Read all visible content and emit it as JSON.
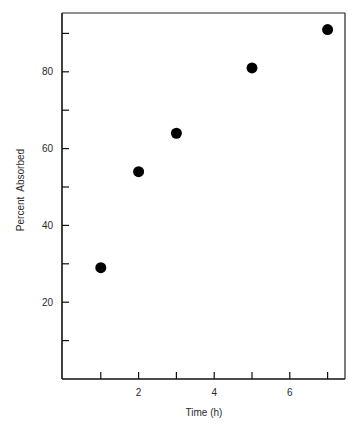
{
  "chart_data": {
    "type": "scatter",
    "title": "",
    "xlabel": "Time (h)",
    "ylabel": "Percent  Absorbed",
    "xlim": [
      0,
      7.5
    ],
    "ylim": [
      0,
      95
    ],
    "x_ticks": [
      1,
      2,
      3,
      4,
      5,
      6,
      7
    ],
    "x_tick_labels": [
      "",
      "2",
      "",
      "4",
      "",
      "6",
      ""
    ],
    "y_ticks": [
      10,
      20,
      30,
      40,
      50,
      60,
      70,
      80,
      90
    ],
    "y_tick_labels": [
      "",
      "20",
      "",
      "40",
      "",
      "60",
      "",
      "80",
      ""
    ],
    "grid": false,
    "legend": null,
    "series": [
      {
        "name": "Percent Absorbed",
        "marker": "filled-circle",
        "color": "#000000",
        "points": [
          {
            "x": 1,
            "y": 29
          },
          {
            "x": 2,
            "y": 54
          },
          {
            "x": 3,
            "y": 64
          },
          {
            "x": 5,
            "y": 81
          },
          {
            "x": 7,
            "y": 91
          }
        ]
      }
    ]
  }
}
